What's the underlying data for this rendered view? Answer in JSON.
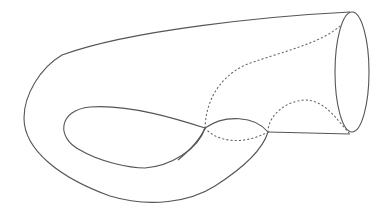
{
  "figure": {
    "stroke_color": "#555555",
    "background": "#ffffff",
    "styles": {
      "visible_edges": "solid",
      "hidden_edges": "dotted"
    }
  }
}
